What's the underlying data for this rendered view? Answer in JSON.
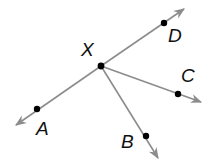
{
  "diagram": {
    "type": "rays-from-common-endpoint",
    "vertex": {
      "label": "X",
      "x": 101,
      "y": 66,
      "label_x": 81,
      "label_y": 56
    },
    "rays": [
      {
        "label": "D",
        "point": [
          164,
          23
        ],
        "tip": [
          184,
          9
        ],
        "label_pos": [
          168,
          42
        ]
      },
      {
        "label": "C",
        "point": [
          178,
          94
        ],
        "tip": [
          201,
          102
        ],
        "label_pos": [
          181,
          82
        ]
      },
      {
        "label": "B",
        "point": [
          146,
          136
        ],
        "tip": [
          158,
          158
        ],
        "label_pos": [
          121,
          148
        ]
      },
      {
        "label": "A",
        "point": [
          37,
          109
        ],
        "tip": [
          16,
          125
        ],
        "label_pos": [
          36,
          135
        ]
      }
    ],
    "colors": {
      "line": "#8c8c8c",
      "point": "#000000",
      "label": "#111111"
    }
  }
}
